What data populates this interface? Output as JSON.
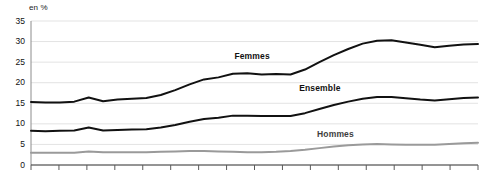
{
  "chart_data": {
    "type": "line",
    "title": "",
    "subtitle": "",
    "xlabel": "",
    "ylabel": "en %",
    "unit_label": "en %",
    "ylim": [
      0,
      35
    ],
    "yticks": [
      0,
      5,
      10,
      15,
      20,
      25,
      30,
      35
    ],
    "ytick_labels": [
      "0",
      "5",
      "10",
      "15",
      "20",
      "25",
      "30",
      "35"
    ],
    "grid": true,
    "grid_axis": "y",
    "legend_position": "inline-annotations",
    "x_tick_count": 16,
    "x_axis_labels_visible": false,
    "x": [
      0,
      1,
      2,
      3,
      4,
      5,
      6,
      7,
      8,
      9,
      10,
      11,
      12,
      13,
      14,
      15,
      16,
      17,
      18,
      19,
      20,
      21,
      22,
      23,
      24,
      25,
      26,
      27,
      28,
      29,
      30,
      31
    ],
    "series": [
      {
        "name": "Femmes",
        "color": "#111111",
        "width": 2.0,
        "label_x_frac": 0.455,
        "label_y_value": 26.5,
        "values": [
          15.3,
          15.2,
          15.2,
          15.4,
          16.4,
          15.5,
          15.9,
          16.1,
          16.3,
          17.0,
          18.2,
          19.6,
          20.8,
          21.3,
          22.2,
          22.3,
          22.0,
          22.1,
          22.0,
          23.2,
          25.0,
          26.7,
          28.2,
          29.5,
          30.2,
          30.3,
          29.8,
          29.2,
          28.6,
          29.0,
          29.3,
          29.4
        ]
      },
      {
        "name": "Ensemble",
        "color": "#111111",
        "width": 2.0,
        "label_x_frac": 0.6,
        "label_y_value": 18.8,
        "values": [
          8.3,
          8.2,
          8.3,
          8.4,
          9.1,
          8.4,
          8.5,
          8.6,
          8.7,
          9.1,
          9.7,
          10.5,
          11.2,
          11.5,
          12.0,
          12.0,
          11.9,
          11.9,
          11.9,
          12.6,
          13.6,
          14.6,
          15.4,
          16.1,
          16.5,
          16.5,
          16.2,
          15.9,
          15.7,
          16.0,
          16.3,
          16.4
        ]
      },
      {
        "name": "Hommes",
        "color": "#9a9a9a",
        "width": 2.0,
        "label_x_frac": 0.64,
        "label_y_value": 7.5,
        "values": [
          3.0,
          3.0,
          3.0,
          3.0,
          3.3,
          3.1,
          3.1,
          3.1,
          3.1,
          3.2,
          3.3,
          3.4,
          3.4,
          3.3,
          3.2,
          3.1,
          3.1,
          3.2,
          3.4,
          3.7,
          4.1,
          4.5,
          4.8,
          5.0,
          5.1,
          5.0,
          4.9,
          4.9,
          4.9,
          5.1,
          5.3,
          5.4
        ]
      }
    ]
  },
  "style": {
    "grid_color": "#e3e3e3",
    "axis_color": "#8c8c8c",
    "tick_color": "#5a5a5a",
    "background": "#ffffff"
  }
}
